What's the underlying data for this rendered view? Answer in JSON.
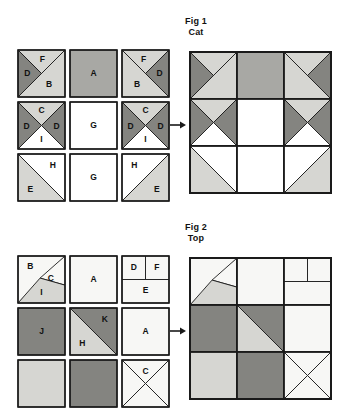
{
  "page": {
    "width": 343,
    "height": 371,
    "background": "#ffffff"
  },
  "palette": {
    "white": "#ffffff",
    "near_white": "#f7f7f5",
    "light_gray": "#d6d6d2",
    "medium_gray": "#a8a8a4",
    "dark_gray": "#848480",
    "outline": "#1a1a1a",
    "text": "#111111"
  },
  "figures": [
    {
      "id": "fig1",
      "title_line1": "Fig 1",
      "title_line2": "Cat",
      "title_x": 196,
      "title_y": 16,
      "units_origin": {
        "x": 18,
        "y": 50
      },
      "unit_size": 47,
      "unit_gap": 5,
      "assembly_origin": {
        "x": 190,
        "y": 52
      },
      "assembly_cell": 47,
      "arrow": {
        "x": 170,
        "y": 120,
        "width": 16,
        "height": 10
      },
      "units": [
        {
          "name": "unit-r1c1",
          "row": 0,
          "col": 0,
          "patches": [
            {
              "label": "F",
              "shape": "tri-top",
              "fill": "light_gray",
              "lx": 0.52,
              "ly": 0.2
            },
            {
              "label": "D",
              "shape": "tri-left",
              "fill": "dark_gray",
              "lx": 0.2,
              "ly": 0.5
            },
            {
              "label": "B",
              "shape": "tri-bottomright",
              "fill": "light_gray",
              "lx": 0.66,
              "ly": 0.74
            }
          ]
        },
        {
          "name": "unit-r1c2",
          "row": 0,
          "col": 1,
          "patches": [
            {
              "label": "A",
              "shape": "full",
              "fill": "medium_gray",
              "lx": 0.5,
              "ly": 0.5
            }
          ]
        },
        {
          "name": "unit-r1c3",
          "row": 0,
          "col": 2,
          "patches": [
            {
              "label": "F",
              "shape": "tri-top",
              "fill": "light_gray",
              "lx": 0.46,
              "ly": 0.2
            },
            {
              "label": "D",
              "shape": "tri-right",
              "fill": "dark_gray",
              "lx": 0.8,
              "ly": 0.5
            },
            {
              "label": "B",
              "shape": "tri-bottomleft",
              "fill": "light_gray",
              "lx": 0.32,
              "ly": 0.74
            }
          ]
        },
        {
          "name": "unit-r2c1",
          "row": 1,
          "col": 0,
          "patches": [
            {
              "label": "C",
              "shape": "tri-top",
              "fill": "light_gray",
              "lx": 0.5,
              "ly": 0.19
            },
            {
              "label": "D",
              "shape": "tri-left",
              "fill": "dark_gray",
              "lx": 0.18,
              "ly": 0.52
            },
            {
              "label": "D",
              "shape": "tri-right",
              "fill": "dark_gray",
              "lx": 0.82,
              "ly": 0.52
            },
            {
              "label": "I",
              "shape": "tri-bottom",
              "fill": "white",
              "lx": 0.5,
              "ly": 0.8
            }
          ]
        },
        {
          "name": "unit-r2c2",
          "row": 1,
          "col": 1,
          "patches": [
            {
              "label": "G",
              "shape": "full",
              "fill": "white",
              "lx": 0.5,
              "ly": 0.5
            }
          ]
        },
        {
          "name": "unit-r2c3",
          "row": 1,
          "col": 2,
          "patches": [
            {
              "label": "C",
              "shape": "tri-top",
              "fill": "light_gray",
              "lx": 0.5,
              "ly": 0.19
            },
            {
              "label": "D",
              "shape": "tri-left",
              "fill": "dark_gray",
              "lx": 0.18,
              "ly": 0.52
            },
            {
              "label": "D",
              "shape": "tri-right",
              "fill": "dark_gray",
              "lx": 0.82,
              "ly": 0.52
            },
            {
              "label": "I",
              "shape": "tri-bottom",
              "fill": "white",
              "lx": 0.5,
              "ly": 0.8
            }
          ]
        },
        {
          "name": "unit-r3c1",
          "row": 2,
          "col": 0,
          "patches": [
            {
              "label": "H",
              "shape": "tri-topright",
              "fill": "white",
              "lx": 0.74,
              "ly": 0.24
            },
            {
              "label": "E",
              "shape": "tri-bottomleft",
              "fill": "light_gray",
              "lx": 0.26,
              "ly": 0.76
            }
          ]
        },
        {
          "name": "unit-r3c2",
          "row": 2,
          "col": 1,
          "patches": [
            {
              "label": "G",
              "shape": "full",
              "fill": "white",
              "lx": 0.5,
              "ly": 0.5
            }
          ]
        },
        {
          "name": "unit-r3c3",
          "row": 2,
          "col": 2,
          "patches": [
            {
              "label": "H",
              "shape": "tri-topleft",
              "fill": "white",
              "lx": 0.26,
              "ly": 0.24
            },
            {
              "label": "E",
              "shape": "tri-bottomright",
              "fill": "light_gray",
              "lx": 0.74,
              "ly": 0.76
            }
          ]
        }
      ],
      "assembly": [
        {
          "name": "cell-r1c1",
          "row": 0,
          "col": 0,
          "patches": [
            {
              "shape": "tri-topleft",
              "fill": "dark_gray"
            },
            {
              "shape": "tri-top-half-right",
              "fill": "light_gray"
            },
            {
              "shape": "tri-bottomright",
              "fill": "light_gray"
            }
          ]
        },
        {
          "name": "cell-r1c2",
          "row": 0,
          "col": 1,
          "patches": [
            {
              "shape": "full",
              "fill": "medium_gray"
            }
          ]
        },
        {
          "name": "cell-r1c3",
          "row": 0,
          "col": 2,
          "patches": [
            {
              "shape": "tri-topright",
              "fill": "dark_gray"
            },
            {
              "shape": "tri-top-half-left",
              "fill": "light_gray"
            },
            {
              "shape": "tri-bottomleft",
              "fill": "light_gray"
            }
          ]
        },
        {
          "name": "cell-r2c1",
          "row": 1,
          "col": 0,
          "patches": [
            {
              "shape": "tri-top",
              "fill": "light_gray"
            },
            {
              "shape": "tri-left",
              "fill": "dark_gray"
            },
            {
              "shape": "tri-right",
              "fill": "dark_gray"
            },
            {
              "shape": "tri-bottom",
              "fill": "white"
            }
          ]
        },
        {
          "name": "cell-r2c2",
          "row": 1,
          "col": 1,
          "patches": [
            {
              "shape": "full",
              "fill": "white"
            }
          ]
        },
        {
          "name": "cell-r2c3",
          "row": 1,
          "col": 2,
          "patches": [
            {
              "shape": "tri-top",
              "fill": "light_gray"
            },
            {
              "shape": "tri-left",
              "fill": "dark_gray"
            },
            {
              "shape": "tri-right",
              "fill": "dark_gray"
            },
            {
              "shape": "tri-bottom",
              "fill": "white"
            }
          ]
        },
        {
          "name": "cell-r3c1",
          "row": 2,
          "col": 0,
          "patches": [
            {
              "shape": "tri-topright",
              "fill": "white"
            },
            {
              "shape": "tri-bottomleft",
              "fill": "light_gray"
            }
          ]
        },
        {
          "name": "cell-r3c2",
          "row": 2,
          "col": 1,
          "patches": [
            {
              "shape": "full",
              "fill": "white"
            }
          ]
        },
        {
          "name": "cell-r3c3",
          "row": 2,
          "col": 2,
          "patches": [
            {
              "shape": "tri-topleft",
              "fill": "white"
            },
            {
              "shape": "tri-bottomright",
              "fill": "light_gray"
            }
          ]
        }
      ]
    },
    {
      "id": "fig2",
      "title_line1": "Fig 2",
      "title_line2": "Top",
      "title_x": 196,
      "title_y": 222,
      "units_origin": {
        "x": 18,
        "y": 256
      },
      "unit_size": 47,
      "unit_gap": 5,
      "assembly_origin": {
        "x": 190,
        "y": 258
      },
      "assembly_cell": 47,
      "arrow": {
        "x": 170,
        "y": 326,
        "width": 16,
        "height": 10
      },
      "units": [
        {
          "name": "unit-r1c1",
          "row": 0,
          "col": 0,
          "patches": [
            {
              "label": "B",
              "shape": "tri-topleft",
              "fill": "near_white",
              "lx": 0.26,
              "ly": 0.22
            },
            {
              "label": "C",
              "shape": "tri-c-right",
              "fill": "near_white",
              "lx": 0.7,
              "ly": 0.48
            },
            {
              "label": "I",
              "shape": "tri-i-bottom",
              "fill": "light_gray",
              "lx": 0.5,
              "ly": 0.78
            }
          ]
        },
        {
          "name": "unit-r1c2",
          "row": 0,
          "col": 1,
          "patches": [
            {
              "label": "A",
              "shape": "full",
              "fill": "near_white",
              "lx": 0.5,
              "ly": 0.5
            }
          ]
        },
        {
          "name": "unit-r1c3",
          "row": 0,
          "col": 2,
          "patches": [
            {
              "label": "D",
              "shape": "quad-topleft",
              "fill": "near_white",
              "lx": 0.25,
              "ly": 0.24
            },
            {
              "label": "F",
              "shape": "quad-topright",
              "fill": "near_white",
              "lx": 0.74,
              "ly": 0.24
            },
            {
              "label": "E",
              "shape": "half-bottom",
              "fill": "near_white",
              "lx": 0.5,
              "ly": 0.74
            }
          ]
        },
        {
          "name": "unit-r2c1",
          "row": 1,
          "col": 0,
          "patches": [
            {
              "label": "J",
              "shape": "full",
              "fill": "dark_gray",
              "lx": 0.5,
              "ly": 0.5
            }
          ]
        },
        {
          "name": "unit-r2c2",
          "row": 1,
          "col": 1,
          "patches": [
            {
              "label": "K",
              "shape": "tri-topright",
              "fill": "dark_gray",
              "lx": 0.74,
              "ly": 0.24
            },
            {
              "label": "H",
              "shape": "tri-bottomleft",
              "fill": "light_gray",
              "lx": 0.26,
              "ly": 0.76
            }
          ]
        },
        {
          "name": "unit-r2c3",
          "row": 1,
          "col": 2,
          "patches": [
            {
              "label": "A",
              "shape": "full",
              "fill": "near_white",
              "lx": 0.5,
              "ly": 0.5
            }
          ]
        },
        {
          "name": "unit-r3c1",
          "row": 2,
          "col": 0,
          "patches": [
            {
              "label": "",
              "shape": "full",
              "fill": "light_gray",
              "lx": 0.5,
              "ly": 0.5
            }
          ]
        },
        {
          "name": "unit-r3c2",
          "row": 2,
          "col": 1,
          "patches": [
            {
              "label": "",
              "shape": "full",
              "fill": "dark_gray",
              "lx": 0.5,
              "ly": 0.5
            }
          ]
        },
        {
          "name": "unit-r3c3",
          "row": 2,
          "col": 2,
          "patches": [
            {
              "label": "C",
              "shape": "tri-top",
              "fill": "near_white",
              "lx": 0.5,
              "ly": 0.24
            },
            {
              "label": "",
              "shape": "tri-left",
              "fill": "near_white",
              "lx": 0.16,
              "ly": 0.52
            },
            {
              "label": "",
              "shape": "tri-right",
              "fill": "near_white",
              "lx": 0.84,
              "ly": 0.52
            },
            {
              "label": "",
              "shape": "tri-bottom",
              "fill": "near_white",
              "lx": 0.5,
              "ly": 0.82
            }
          ]
        }
      ],
      "assembly": [
        {
          "name": "cell-r1c1",
          "row": 0,
          "col": 0,
          "patches": [
            {
              "shape": "tri-topleft",
              "fill": "near_white"
            },
            {
              "shape": "tri-c-right",
              "fill": "near_white"
            },
            {
              "shape": "tri-i-bottom",
              "fill": "light_gray"
            }
          ]
        },
        {
          "name": "cell-r1c2",
          "row": 0,
          "col": 1,
          "patches": [
            {
              "shape": "full",
              "fill": "near_white"
            }
          ]
        },
        {
          "name": "cell-r1c3",
          "row": 0,
          "col": 2,
          "patches": [
            {
              "shape": "quad-topleft",
              "fill": "near_white"
            },
            {
              "shape": "quad-topright",
              "fill": "near_white"
            },
            {
              "shape": "half-bottom",
              "fill": "near_white"
            }
          ]
        },
        {
          "name": "cell-r2c1",
          "row": 1,
          "col": 0,
          "patches": [
            {
              "shape": "full",
              "fill": "dark_gray"
            }
          ]
        },
        {
          "name": "cell-r2c2",
          "row": 1,
          "col": 1,
          "patches": [
            {
              "shape": "tri-topright",
              "fill": "dark_gray"
            },
            {
              "shape": "tri-bottomleft",
              "fill": "light_gray"
            }
          ]
        },
        {
          "name": "cell-r2c3",
          "row": 1,
          "col": 2,
          "patches": [
            {
              "shape": "full",
              "fill": "near_white"
            }
          ]
        },
        {
          "name": "cell-r3c1",
          "row": 2,
          "col": 0,
          "patches": [
            {
              "shape": "full",
              "fill": "light_gray"
            }
          ]
        },
        {
          "name": "cell-r3c2",
          "row": 2,
          "col": 1,
          "patches": [
            {
              "shape": "full",
              "fill": "dark_gray"
            }
          ]
        },
        {
          "name": "cell-r3c3",
          "row": 2,
          "col": 2,
          "patches": [
            {
              "shape": "tri-top",
              "fill": "near_white"
            },
            {
              "shape": "tri-left",
              "fill": "near_white"
            },
            {
              "shape": "tri-right",
              "fill": "near_white"
            },
            {
              "shape": "tri-bottom",
              "fill": "near_white"
            }
          ]
        }
      ]
    }
  ]
}
